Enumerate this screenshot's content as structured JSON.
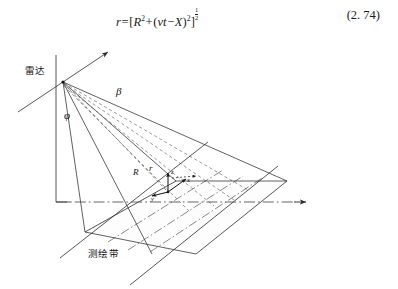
{
  "figure": {
    "equation": {
      "lhs": "r",
      "equals": "=",
      "open_bracket": "[",
      "term1_base": "R",
      "term1_exp": "2",
      "plus": "+",
      "paren_open": "(",
      "term2_a": "vt",
      "minus": "−",
      "term2_b": "X",
      "paren_close": ")",
      "term2_exp": "2",
      "close_bracket": "]",
      "outer_exp_num": "1",
      "outer_exp_den": "2",
      "full_text": "r = [ R² + ( vt − X )² ]^(1/2)"
    },
    "equation_number": "(2. 74)",
    "labels": {
      "radar": "雷达",
      "swath": "测绘带",
      "beta": "β",
      "phi": "φ",
      "range_R": "R",
      "range_r": "r",
      "axis_x": "x",
      "axis_y": "y",
      "axis_z": "z"
    },
    "colors": {
      "line": "#2b2b2b",
      "dashed_beam": "#6f6f6f",
      "dashdot": "#555555",
      "background": "#ffffff"
    }
  }
}
